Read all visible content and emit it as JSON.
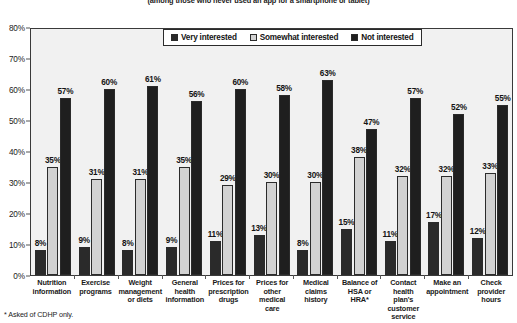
{
  "chart_data": {
    "type": "bar",
    "title": "(among those who never used an app for a smartphone or tablet)",
    "xlabel": "",
    "ylabel": "",
    "ylim": [
      0,
      80
    ],
    "grid": false,
    "legend_position": "top-center",
    "categories": [
      "Nutrition information",
      "Exercise programs",
      "Weight management or diets",
      "General health information",
      "Prices for prescription drugs",
      "Prices for other medical care",
      "Medical claims history",
      "Balance of HSA or HRA*",
      "Contact health plan's customer service",
      "Make an appointment",
      "Check provider hours"
    ],
    "category_lines": [
      [
        "Nutrition",
        "information"
      ],
      [
        "Exercise",
        "programs"
      ],
      [
        "Weight",
        "management",
        "or diets"
      ],
      [
        "General",
        "health",
        "information"
      ],
      [
        "Prices for",
        "prescription",
        "drugs"
      ],
      [
        "Prices for",
        "other",
        "medical care"
      ],
      [
        "Medical",
        "claims",
        "history"
      ],
      [
        "Balance of",
        "HSA or",
        "HRA*"
      ],
      [
        "Contact",
        "health plan's",
        "customer",
        "service"
      ],
      [
        "Make an",
        "appointment"
      ],
      [
        "Check",
        "provider",
        "hours"
      ]
    ],
    "series": [
      {
        "name": "Very interested",
        "color": "#2a2a2a",
        "values": [
          8,
          9,
          8,
          9,
          11,
          13,
          8,
          15,
          11,
          17,
          12
        ],
        "labels": [
          "8%",
          "9%",
          "8%",
          "9%",
          "11%",
          "13%",
          "8%",
          "15%",
          "11%",
          "17%",
          "12%"
        ]
      },
      {
        "name": "Somewhat interested",
        "color": "#d2d2d2",
        "values": [
          35,
          31,
          31,
          35,
          29,
          30,
          30,
          38,
          32,
          32,
          33
        ],
        "labels": [
          "35%",
          "31%",
          "31%",
          "35%",
          "29%",
          "30%",
          "30%",
          "38%",
          "32%",
          "32%",
          "33%"
        ]
      },
      {
        "name": "Not interested",
        "color": "#1f1f1f",
        "values": [
          57,
          60,
          61,
          56,
          60,
          58,
          63,
          47,
          57,
          52,
          55
        ],
        "labels": [
          "57%",
          "60%",
          "61%",
          "56%",
          "60%",
          "58%",
          "63%",
          "47%",
          "57%",
          "52%",
          "55%"
        ]
      }
    ],
    "y_ticks": [
      0,
      10,
      20,
      30,
      40,
      50,
      60,
      70,
      80
    ],
    "y_tick_labels": [
      "0%",
      "10%",
      "20%",
      "30%",
      "40%",
      "50%",
      "60%",
      "70%",
      "80%"
    ]
  },
  "footnote": "* Asked of CDHP only."
}
